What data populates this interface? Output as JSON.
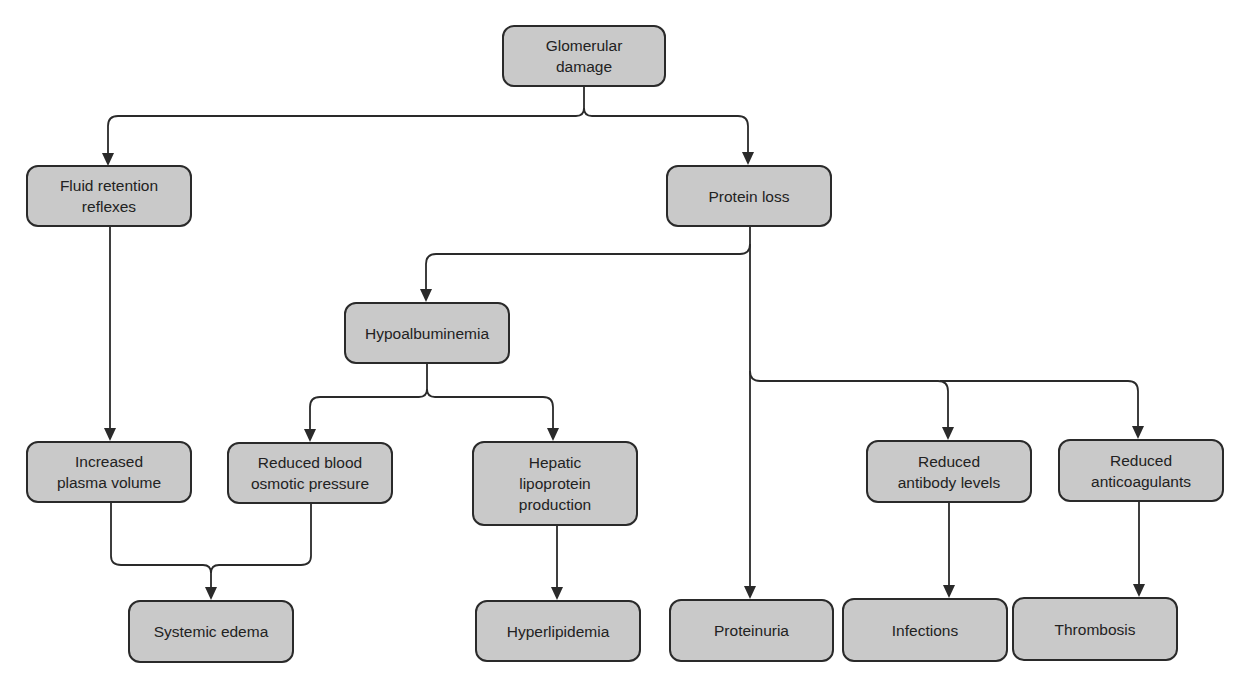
{
  "diagram": {
    "type": "flowchart",
    "colors": {
      "node_fill": "#c9c9c9",
      "node_border": "#2a2a2a",
      "text": "#222222",
      "edge": "#2a2a2a"
    },
    "nodes": {
      "glomerular_damage": "Glomerular\ndamage",
      "fluid_retention": "Fluid retention\nreflexes",
      "protein_loss": "Protein loss",
      "hypoalbuminemia": "Hypoalbuminemia",
      "increased_plasma": "Increased\nplasma volume",
      "reduced_osmotic": "Reduced blood\nosmotic pressure",
      "hepatic_lipoprotein": "Hepatic\nlipoprotein\nproduction",
      "reduced_antibody": "Reduced\nantibody levels",
      "reduced_anticoagulants": "Reduced\nanticoagulants",
      "systemic_edema": "Systemic edema",
      "hyperlipidemia": "Hyperlipidemia",
      "proteinuria": "Proteinuria",
      "infections": "Infections",
      "thrombosis": "Thrombosis"
    },
    "edges": [
      [
        "Glomerular damage",
        "Fluid retention reflexes"
      ],
      [
        "Glomerular damage",
        "Protein loss"
      ],
      [
        "Fluid retention reflexes",
        "Increased plasma volume"
      ],
      [
        "Protein loss",
        "Hypoalbuminemia"
      ],
      [
        "Protein loss",
        "Proteinuria"
      ],
      [
        "Protein loss",
        "Reduced antibody levels"
      ],
      [
        "Protein loss",
        "Reduced anticoagulants"
      ],
      [
        "Hypoalbuminemia",
        "Reduced blood osmotic pressure"
      ],
      [
        "Hypoalbuminemia",
        "Hepatic lipoprotein production"
      ],
      [
        "Increased plasma volume",
        "Systemic edema"
      ],
      [
        "Reduced blood osmotic pressure",
        "Systemic edema"
      ],
      [
        "Hepatic lipoprotein production",
        "Hyperlipidemia"
      ],
      [
        "Reduced antibody levels",
        "Infections"
      ],
      [
        "Reduced anticoagulants",
        "Thrombosis"
      ]
    ]
  }
}
